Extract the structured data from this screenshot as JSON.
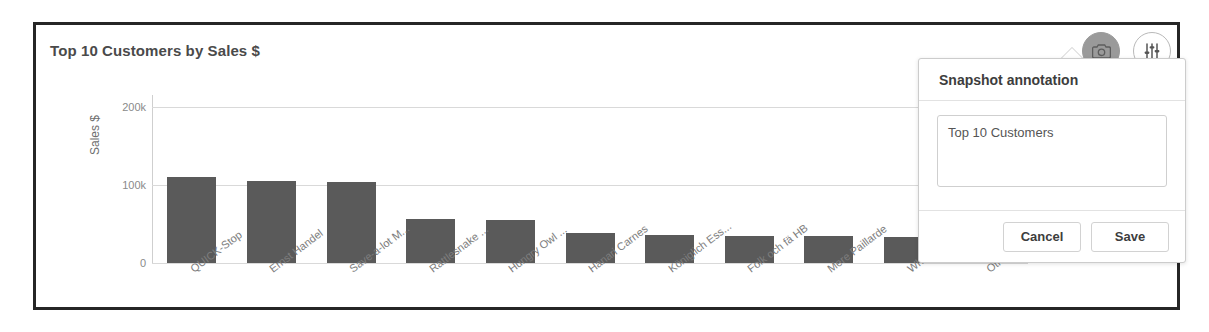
{
  "chart_data": {
    "type": "bar",
    "title": "Top 10 Customers by Sales $",
    "xlabel": "",
    "ylabel": "Sales $",
    "ylim": [
      0,
      215
    ],
    "yticks": [
      "0",
      "100k",
      "200k"
    ],
    "grid": true,
    "legend": "none",
    "unit": "k",
    "clipped_bar": "Others",
    "categories": [
      "QUICK-Stop",
      "Ernst Handel",
      "Save-a-lot M...",
      "Rattlesnake ...",
      "Hungry Owl ...",
      "Hanari Carnes",
      "Königlich Ess...",
      "Folk och fä HB",
      "Mere Paillarde",
      "White Clover ...",
      "Others"
    ],
    "values": [
      110,
      105,
      104,
      56,
      55,
      38,
      36,
      35,
      34,
      33,
      215
    ],
    "colors": {
      "bar": "#5a5a5a",
      "bar_others": "#9a9a9a",
      "gridline": "#d9d9d9",
      "axis": "#bdbdbd",
      "tick_text": "#8a8a8a"
    }
  },
  "toolbar": {
    "buttons": [
      {
        "name": "snapshot",
        "icon": "camera-icon",
        "active": true
      },
      {
        "name": "options",
        "icon": "sliders-icon",
        "active": false
      },
      {
        "name": "more",
        "icon": "more-icon",
        "active": false
      }
    ]
  },
  "popup": {
    "title": "Snapshot annotation",
    "annotation_value": "Top 10 Customers",
    "annotation_placeholder": "Snapshot annotation",
    "cancel_label": "Cancel",
    "save_label": "Save"
  }
}
